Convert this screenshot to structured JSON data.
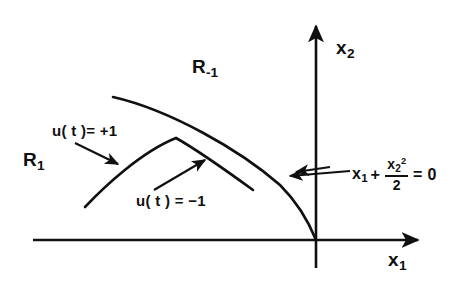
{
  "figure": {
    "type": "phase-plane-switching-curve-diagram",
    "background_color": "#ffffff",
    "ink_color": "#101010"
  },
  "axes": {
    "x_axis_label": "x",
    "x_axis_subscript": "1",
    "y_axis_label": "x",
    "y_axis_subscript": "2",
    "origin": {
      "x": 316,
      "y": 240
    },
    "x_axis_start_x": 33,
    "x_axis_end_x": 424,
    "y_axis_top_y": 20,
    "y_axis_bottom_y": 268
  },
  "regions": [
    {
      "id": "region-minus-one",
      "label_base": "R",
      "label_subscript": "-1",
      "position": {
        "x": 192,
        "y": 57
      }
    },
    {
      "id": "region-one",
      "label_base": "R",
      "label_subscript": "1",
      "position": {
        "x": 23,
        "y": 150
      }
    }
  ],
  "control_labels": [
    {
      "id": "control-plus-one",
      "text": "u( t )= +1",
      "position": {
        "x": 52,
        "y": 123
      }
    },
    {
      "id": "control-minus-one",
      "text": "u( t ) = −1",
      "position": {
        "x": 136,
        "y": 193
      }
    }
  ],
  "equation": {
    "term1_base": "x",
    "term1_subscript": "1",
    "plus": "+",
    "numerator_base": "x",
    "numerator_subscript": "2",
    "numerator_superscript": "2",
    "denominator": "2",
    "equals": "= 0",
    "position": {
      "x": 352,
      "y": 158
    }
  },
  "curves": [
    {
      "id": "switching-curve",
      "description": "outer switching curve reaching the origin",
      "path": "M 113 97 C 170 110, 240 150, 280 185 C 298 203, 310 225, 316 240"
    },
    {
      "id": "inner-trajectory",
      "description": "inner trajectory arc with cusp peak",
      "peak": {
        "x": 176,
        "y": 138
      },
      "path_left": "M 85 207 C 105 186, 140 152, 176 138",
      "path_right": "M 176 138 C 200 152, 232 175, 253 190"
    }
  ],
  "pointers": [
    {
      "id": "pointer-control-plus",
      "from": {
        "x": 75,
        "y": 143
      },
      "to": {
        "x": 121,
        "y": 166
      }
    },
    {
      "id": "pointer-control-minus",
      "from": {
        "x": 154,
        "y": 190
      },
      "to": {
        "x": 207,
        "y": 158
      }
    },
    {
      "id": "pointer-equation",
      "from": {
        "x": 348,
        "y": 172
      },
      "to": {
        "x": 288,
        "y": 176
      }
    }
  ]
}
